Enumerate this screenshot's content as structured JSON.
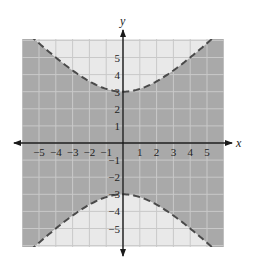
{
  "chart_data": {
    "type": "area",
    "title": "",
    "xlabel": "x",
    "ylabel": "y",
    "xlim": [
      -6,
      6
    ],
    "ylim": [
      -6.2,
      6.2
    ],
    "grid": true,
    "x_ticks": [
      "-5",
      "-4",
      "-3",
      "-2",
      "-1",
      "1",
      "2",
      "3",
      "4",
      "5"
    ],
    "y_ticks": [
      "5",
      "4",
      "3",
      "2",
      "1",
      "-1",
      "-2",
      "-3",
      "-4",
      "-5"
    ],
    "boundary": {
      "equation": "y^2 - x^2 = 9",
      "style": "dashed",
      "branches": [
        {
          "name": "upper",
          "vertex": [
            0,
            3
          ],
          "x": [
            -5.4,
            -4,
            -3,
            -2,
            -1,
            0,
            1,
            2,
            3,
            4,
            5.4
          ],
          "y": [
            6.16,
            5,
            4.24,
            3.61,
            3.16,
            3,
            3.16,
            3.61,
            4.24,
            5,
            6.16
          ]
        },
        {
          "name": "lower",
          "vertex": [
            0,
            -3
          ],
          "x": [
            -5.4,
            -4,
            -3,
            -2,
            -1,
            0,
            1,
            2,
            3,
            4,
            5.4
          ],
          "y": [
            -6.16,
            -5,
            -4.24,
            -3.61,
            -3.16,
            -3,
            -3.16,
            -3.61,
            -4.24,
            -5,
            -6.16
          ]
        }
      ]
    },
    "shaded_region": "y^2 - x^2 < 9 (between the two branches)",
    "colors": {
      "shaded": "#a9a9a9",
      "unshaded": "#e9e9e9",
      "gridline": "#c9c9c9",
      "boundary": "#4a4a4a",
      "axis": "#1a1a1a"
    }
  }
}
